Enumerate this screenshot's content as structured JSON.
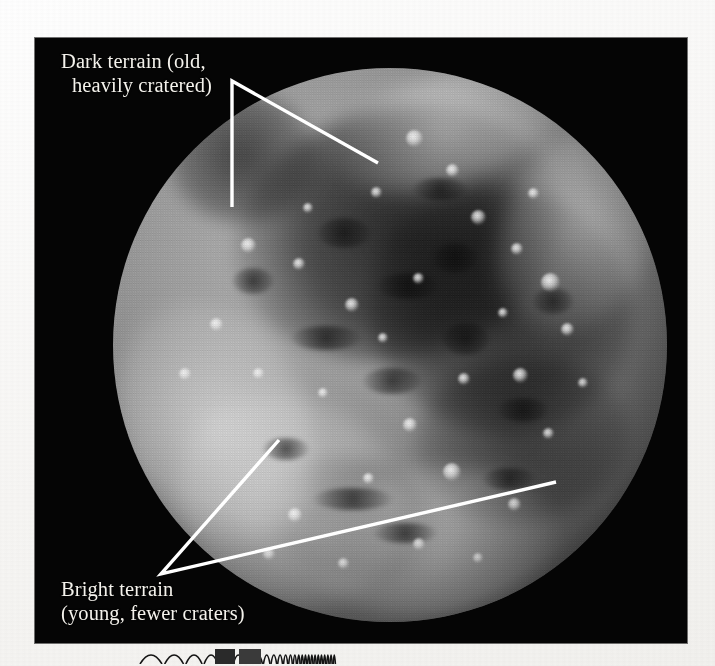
{
  "page": {
    "background_color": "#fbfbfa",
    "kind": "printed-textbook-figure"
  },
  "photo": {
    "background_color": "#050505",
    "subject": "ganymede-full-disc",
    "rect": {
      "x": 35,
      "y": 38,
      "width": 652,
      "height": 605
    }
  },
  "annotations": [
    {
      "id": "dark-terrain",
      "line1": "Dark terrain (old,",
      "line2": "heavily cratered)",
      "text_color": "#f4f2ec",
      "leader_color": "#ffffff",
      "leader_vertex": {
        "x": 232,
        "y": 81
      },
      "leader_ends": [
        {
          "x": 232,
          "y": 207
        },
        {
          "x": 378,
          "y": 163
        }
      ]
    },
    {
      "id": "bright-terrain",
      "line1": "Bright terrain",
      "line2": "(young, fewer craters)",
      "text_color": "#f4f2ec",
      "leader_color": "#ffffff",
      "leader_vertex": {
        "x": 161,
        "y": 574
      },
      "leader_ends": [
        {
          "x": 279,
          "y": 440
        },
        {
          "x": 556,
          "y": 482
        }
      ]
    }
  ],
  "moon": {
    "name": "ganymede-disc",
    "center": {
      "x": 390,
      "y": 345
    },
    "radius": 277,
    "surface_tone_light": "#b9b9b9",
    "surface_tone_dark": "#373737"
  },
  "print_strip": {
    "name": "printers-resolution-wedge",
    "arch_count": 26,
    "color": "#1a1a1a"
  }
}
